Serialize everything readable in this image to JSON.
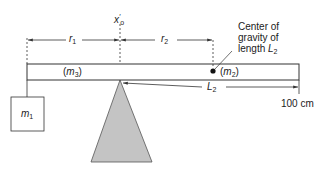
{
  "diagram": {
    "type": "physics-balance-beam",
    "pivot_label": {
      "main": "x",
      "prime": "′",
      "sub": "o"
    },
    "distances": {
      "r1": {
        "main": "r",
        "sub": "1"
      },
      "r2": {
        "main": "r",
        "sub": "2"
      },
      "L2": {
        "main": "L",
        "sub": "2"
      }
    },
    "masses": {
      "m1": {
        "main": "m",
        "sub": "1"
      },
      "m2": {
        "open": "(",
        "main": "m",
        "sub": "2",
        "close": ")"
      },
      "m3": {
        "open": "(",
        "main": "m",
        "sub": "3",
        "close": ")"
      }
    },
    "annotation": {
      "line1": "Center of",
      "line2": "gravity of",
      "line3_prefix": "length ",
      "line3_var": "L",
      "line3_sub": "2"
    },
    "scale_end_label": "100 cm",
    "colors": {
      "line": "#333333",
      "fulcrum_fill": "#c4c4c4",
      "bar_fill": "#ffffff"
    }
  }
}
